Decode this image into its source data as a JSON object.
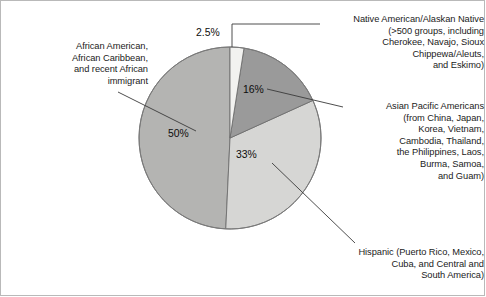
{
  "chart_data": {
    "type": "pie",
    "title": "",
    "subtitle": "",
    "xlabel": "",
    "ylabel": "",
    "legend_position": "callout-labels",
    "grid": false,
    "start_angle_deg": 0,
    "direction": "clockwise",
    "categories": [
      "Native American/Alaskan Native (>500 groups, including Cherokee, Navajo, Sioux Chippewa/Aleuts, and Eskimo)",
      "Asian Pacific Americans (from China, Japan, Korea, Vietnam, Cambodia, Thailand, the Philippines, Laos, Burma, Samoa, and Guam)",
      "Hispanic (Puerto Rico, Mexico, Cuba, and Central and South America)",
      "African American, African Caribbean, and recent African immigrant"
    ],
    "values": [
      2.5,
      16,
      33,
      50
    ],
    "value_labels": [
      "2.5%",
      "16%",
      "33%",
      "50%"
    ],
    "colors": [
      "#f2f2f0",
      "#9a9a9a",
      "#d6d6d4",
      "#b4b4b2"
    ],
    "slice_outline_color": "#6e6e6e",
    "units": "percent"
  },
  "labels": {
    "native": {
      "name": "native-american-label",
      "lines": [
        "Native American/Alaskan Native",
        "(>500 groups, including",
        "Cherokee, Navajo, Sioux",
        "Chippewa/Aleuts,",
        "and Eskimo)"
      ],
      "text": "Native American/Alaskan Native\n(>500 groups, including\nCherokee, Navajo, Sioux\nChippewa/Aleuts,\nand Eskimo)"
    },
    "asian": {
      "name": "asian-pacific-label",
      "lines": [
        "Asian Pacific Americans",
        "(from China, Japan,",
        "Korea, Vietnam,",
        "Cambodia, Thailand,",
        "the Philippines, Laos,",
        "Burma, Samoa,",
        "and Guam)"
      ],
      "text": "Asian Pacific Americans\n(from China, Japan,\nKorea, Vietnam,\nCambodia, Thailand,\nthe Philippines, Laos,\nBurma, Samoa,\nand Guam)"
    },
    "hispanic": {
      "name": "hispanic-label",
      "lines": [
        "Hispanic (Puerto Rico, Mexico,",
        "Cuba, and Central and",
        "South America)"
      ],
      "text": "Hispanic (Puerto Rico, Mexico,\nCuba, and Central and\nSouth America)"
    },
    "african": {
      "name": "african-american-label",
      "lines": [
        "African American,",
        "African Caribbean,",
        "and recent African",
        "immigrant"
      ],
      "text": "African American,\nAfrican Caribbean,\nand recent African\nimmigrant"
    }
  },
  "percent_labels": {
    "native": "2.5%",
    "asian": "16%",
    "hispanic": "33%",
    "african": "50%"
  }
}
